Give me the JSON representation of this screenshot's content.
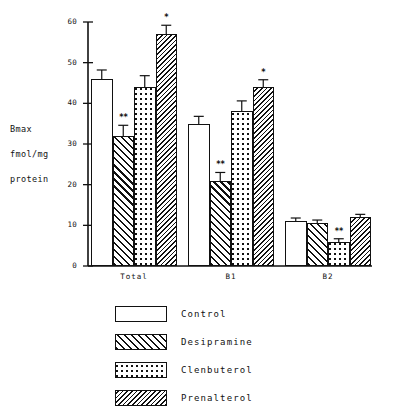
{
  "chart_data": {
    "type": "bar",
    "title": "",
    "xlabel": "",
    "ylabel": "Bmax\nfmol/mg\nprotein",
    "categories": [
      "Total",
      "B1",
      "B2"
    ],
    "ylim": [
      0,
      60
    ],
    "yticks": [
      0,
      10,
      20,
      30,
      40,
      50,
      60
    ],
    "ytick_labels": [
      "0",
      "10",
      "20",
      "30",
      "40",
      "50",
      "60"
    ],
    "grid": false,
    "legend_position": "bottom",
    "series": [
      {
        "name": "Control",
        "fill": "white",
        "values": [
          46.0,
          35.0,
          11.0
        ],
        "errors": [
          2.2,
          1.8,
          0.8
        ],
        "significance": [
          "",
          "",
          ""
        ]
      },
      {
        "name": "Desipramine",
        "fill": "diagonal-hatch",
        "values": [
          32.0,
          21.0,
          10.5
        ],
        "errors": [
          2.6,
          2.0,
          0.8
        ],
        "significance": [
          "**",
          "**",
          ""
        ]
      },
      {
        "name": "Clenbuterol",
        "fill": "black-checker",
        "values": [
          44.0,
          38.0,
          6.0
        ],
        "errors": [
          2.8,
          2.6,
          0.7
        ],
        "significance": [
          "",
          "",
          "**"
        ]
      },
      {
        "name": "Prenalterol",
        "fill": "fine-diagonal-hatch",
        "values": [
          57.0,
          44.0,
          12.0
        ],
        "errors": [
          2.2,
          1.8,
          0.7
        ],
        "significance": [
          "*",
          "*",
          ""
        ]
      }
    ]
  },
  "axis": {
    "y_title_line1": "Bmax",
    "y_title_line2": "fmol/mg",
    "y_title_line3": "protein"
  },
  "legend": {
    "items": [
      {
        "label": "Control"
      },
      {
        "label": "Desipramine"
      },
      {
        "label": "Clenbuterol"
      },
      {
        "label": "Prenalterol"
      }
    ]
  },
  "colors": {
    "ink": "#111111",
    "background": "#ffffff"
  }
}
